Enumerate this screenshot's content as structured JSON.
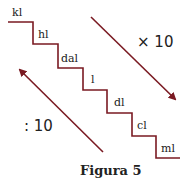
{
  "figure": {
    "caption": "Figura 5",
    "units": [
      "kl",
      "hl",
      "dal",
      "l",
      "dl",
      "cl",
      "ml"
    ],
    "down_arrow_label": "× 10",
    "up_arrow_label": ": 10",
    "line_color": "#7a1a22"
  }
}
